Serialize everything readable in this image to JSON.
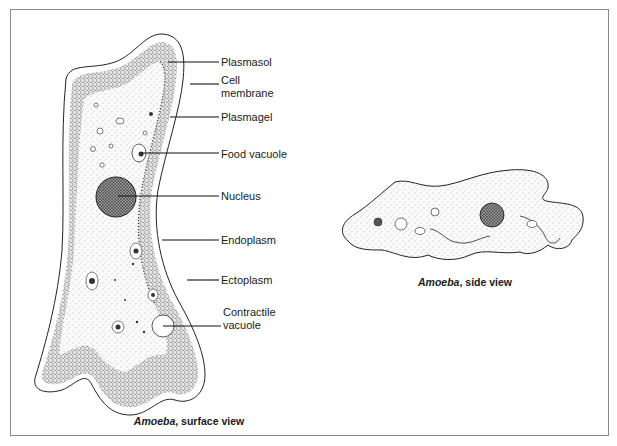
{
  "figure": {
    "surface_view": {
      "caption_italic": "Amoeba",
      "caption_rest": ", surface view",
      "labels": [
        {
          "text": "Plasmasol",
          "x": 221,
          "y": 56
        },
        {
          "text": "Cell",
          "x": 221,
          "y": 74
        },
        {
          "text": "membrane",
          "x": 221,
          "y": 87
        },
        {
          "text": "Plasmagel",
          "x": 221,
          "y": 111
        },
        {
          "text": "Food vacuole",
          "x": 221,
          "y": 148
        },
        {
          "text": "Nucleus",
          "x": 221,
          "y": 190
        },
        {
          "text": "Endoplasm",
          "x": 221,
          "y": 234
        },
        {
          "text": "Ectoplasm",
          "x": 221,
          "y": 274
        },
        {
          "text": "Contractile",
          "x": 223,
          "y": 306
        },
        {
          "text": "vacuole",
          "x": 223,
          "y": 319
        }
      ]
    },
    "side_view": {
      "caption_italic": "Amoeba",
      "caption_rest": ", side view"
    }
  }
}
